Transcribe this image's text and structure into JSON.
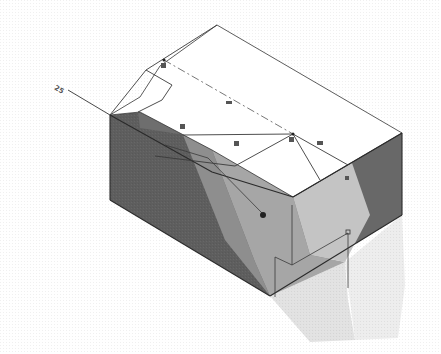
{
  "figure": {
    "type": "isometric-solid-model",
    "colors": {
      "background": "#ffffff",
      "top_face": "#ffffff",
      "left_face": "#5e5e5e",
      "right_face": "#6a6a6a",
      "lit_band_dark": "#9a9a9a",
      "lit_band_mid": "#b4b4b4",
      "lit_band_light": "#cdcdcd",
      "shadow_light": "#e4e4e4",
      "shadow_lighter": "#efefef",
      "edge": "#2a2a2a",
      "sketch_line": "#3a3a3a",
      "centerline": "#555555"
    },
    "markers": {
      "dimension_tag": "25",
      "relation_icons": [
        "coincident",
        "parallel",
        "parallel",
        "perpendicular",
        "horizontal",
        "fixed",
        "midpoint",
        "endpoint"
      ]
    }
  }
}
